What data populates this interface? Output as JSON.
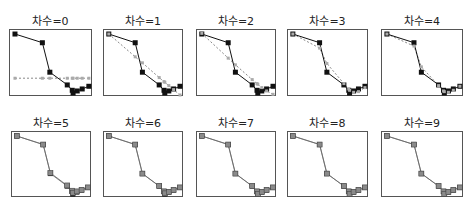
{
  "chart_data": {
    "type": "line",
    "title": "",
    "xlabel": "",
    "ylabel": "",
    "grid": false,
    "layout": "2x5 small multiples",
    "colors": {
      "data": "#111111",
      "fit": "#888888",
      "frame": "#555555"
    },
    "data_points_normalized": [
      [
        0.06,
        0.06
      ],
      [
        0.39,
        0.19
      ],
      [
        0.48,
        0.63
      ],
      [
        0.69,
        0.82
      ],
      [
        0.75,
        0.9
      ],
      [
        0.76,
        0.94
      ],
      [
        0.81,
        0.91
      ],
      [
        0.87,
        0.88
      ],
      [
        0.95,
        0.84
      ]
    ],
    "panels": [
      {
        "label": "차수=0",
        "degree": 0,
        "fit": [
          [
            0.06,
            0.72
          ],
          [
            0.39,
            0.72
          ],
          [
            0.48,
            0.72
          ],
          [
            0.69,
            0.72
          ],
          [
            0.75,
            0.72
          ],
          [
            0.76,
            0.72
          ],
          [
            0.81,
            0.72
          ],
          [
            0.87,
            0.72
          ],
          [
            0.95,
            0.72
          ]
        ]
      },
      {
        "label": "차수=1",
        "degree": 1,
        "fit": [
          [
            0.06,
            0.06
          ],
          [
            0.39,
            0.4
          ],
          [
            0.48,
            0.49
          ],
          [
            0.69,
            0.71
          ],
          [
            0.75,
            0.77
          ],
          [
            0.76,
            0.78
          ],
          [
            0.81,
            0.83
          ],
          [
            0.87,
            0.89
          ],
          [
            0.95,
            0.97
          ]
        ]
      },
      {
        "label": "차수=2",
        "degree": 2,
        "fit": [
          [
            0.06,
            0.05
          ],
          [
            0.39,
            0.42
          ],
          [
            0.48,
            0.52
          ],
          [
            0.69,
            0.74
          ],
          [
            0.75,
            0.8
          ],
          [
            0.76,
            0.81
          ],
          [
            0.81,
            0.86
          ],
          [
            0.87,
            0.91
          ],
          [
            0.95,
            0.96
          ]
        ]
      },
      {
        "label": "차수=3",
        "degree": 3,
        "fit": [
          [
            0.06,
            0.06
          ],
          [
            0.39,
            0.27
          ],
          [
            0.48,
            0.5
          ],
          [
            0.69,
            0.8
          ],
          [
            0.75,
            0.88
          ],
          [
            0.76,
            0.9
          ],
          [
            0.81,
            0.93
          ],
          [
            0.87,
            0.92
          ],
          [
            0.95,
            0.86
          ]
        ]
      },
      {
        "label": "차수=4",
        "degree": 4,
        "fit": [
          [
            0.06,
            0.06
          ],
          [
            0.39,
            0.24
          ],
          [
            0.48,
            0.55
          ],
          [
            0.69,
            0.83
          ],
          [
            0.75,
            0.91
          ],
          [
            0.76,
            0.92
          ],
          [
            0.81,
            0.93
          ],
          [
            0.87,
            0.9
          ],
          [
            0.95,
            0.84
          ]
        ]
      },
      {
        "label": "차수=5",
        "degree": 5,
        "fit": [
          [
            0.06,
            0.06
          ],
          [
            0.39,
            0.19
          ],
          [
            0.48,
            0.62
          ],
          [
            0.69,
            0.81
          ],
          [
            0.75,
            0.89
          ],
          [
            0.76,
            0.92
          ],
          [
            0.81,
            0.9
          ],
          [
            0.87,
            0.88
          ],
          [
            0.95,
            0.84
          ]
        ]
      },
      {
        "label": "차수=6",
        "degree": 6,
        "fit": [
          [
            0.06,
            0.06
          ],
          [
            0.39,
            0.19
          ],
          [
            0.48,
            0.63
          ],
          [
            0.69,
            0.82
          ],
          [
            0.75,
            0.9
          ],
          [
            0.76,
            0.93
          ],
          [
            0.81,
            0.91
          ],
          [
            0.87,
            0.88
          ],
          [
            0.95,
            0.84
          ]
        ]
      },
      {
        "label": "차수=7",
        "degree": 7,
        "fit": [
          [
            0.06,
            0.06
          ],
          [
            0.39,
            0.19
          ],
          [
            0.48,
            0.63
          ],
          [
            0.69,
            0.82
          ],
          [
            0.75,
            0.9
          ],
          [
            0.76,
            0.94
          ],
          [
            0.81,
            0.91
          ],
          [
            0.87,
            0.88
          ],
          [
            0.95,
            0.84
          ]
        ]
      },
      {
        "label": "차수=8",
        "degree": 8,
        "fit": [
          [
            0.06,
            0.06
          ],
          [
            0.39,
            0.19
          ],
          [
            0.48,
            0.63
          ],
          [
            0.69,
            0.82
          ],
          [
            0.75,
            0.9
          ],
          [
            0.76,
            0.94
          ],
          [
            0.81,
            0.91
          ],
          [
            0.87,
            0.88
          ],
          [
            0.95,
            0.84
          ]
        ]
      },
      {
        "label": "차수=9",
        "degree": 9,
        "fit": [
          [
            0.06,
            0.06
          ],
          [
            0.39,
            0.19
          ],
          [
            0.48,
            0.63
          ],
          [
            0.69,
            0.82
          ],
          [
            0.75,
            0.9
          ],
          [
            0.76,
            0.94
          ],
          [
            0.81,
            0.91
          ],
          [
            0.87,
            0.88
          ],
          [
            0.95,
            0.84
          ]
        ]
      }
    ]
  }
}
